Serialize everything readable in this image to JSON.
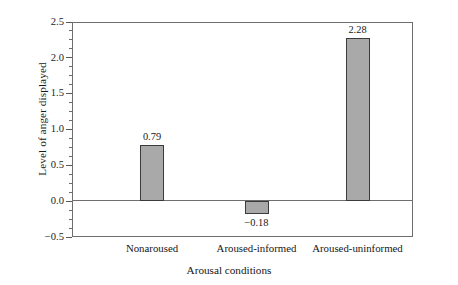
{
  "chart_data": {
    "type": "bar",
    "title": "",
    "xlabel": "Arousal conditions",
    "ylabel": "Level of anger displayed",
    "categories": [
      "Nonaroused",
      "Aroused-informed",
      "Aroused-uninformed"
    ],
    "values": [
      0.79,
      -0.18,
      2.28
    ],
    "value_labels": [
      "0.79",
      "−0.18",
      "2.28"
    ],
    "ylim": [
      -0.5,
      2.5
    ],
    "ytick_major_step": 0.5,
    "ytick_minor_step": 0.125,
    "ytick_labels": [
      "2.5",
      "2.0",
      "1.5",
      "1.0",
      "0.5",
      "0.0",
      "-0.5"
    ],
    "ytick_values": [
      2.5,
      2.0,
      1.5,
      1.0,
      0.5,
      0.0,
      -0.5
    ],
    "grid": false,
    "legend": null,
    "bar_fill_color": "#a9a9a9",
    "bar_edge_color": "#3b3b3b",
    "axis_color": "#6e6e6e",
    "background_color": "#ffffff",
    "zero_baseline": 0.0
  },
  "axis": {
    "y_title": "Level of anger displayed",
    "x_title": "Arousal conditions",
    "ticks": [
      {
        "label": "2.5",
        "value": 2.5
      },
      {
        "label": "2.0",
        "value": 2.0
      },
      {
        "label": "1.5",
        "value": 1.5
      },
      {
        "label": "1.0",
        "value": 1.0
      },
      {
        "label": "0.5",
        "value": 0.5
      },
      {
        "label": "0.0",
        "value": 0.0
      },
      {
        "label": "−0.5",
        "value": -0.5
      }
    ]
  },
  "bars": [
    {
      "category": "Nonaroused",
      "value": 0.79,
      "value_label": "0.79"
    },
    {
      "category": "Aroused-informed",
      "value": -0.18,
      "value_label": "−0.18"
    },
    {
      "category": "Aroused-uninformed",
      "value": 2.28,
      "value_label": "2.28"
    }
  ]
}
